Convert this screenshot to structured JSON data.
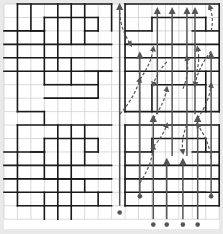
{
  "diagram": {
    "title": "",
    "background": "#e9e9e9",
    "panel_color": "#ffffff",
    "grid": {
      "origin_x": 4,
      "origin_y": 4,
      "cols": 16,
      "rows": 16,
      "cell": 13.45,
      "grid_color": "#cfcfcf",
      "wall_color": "#1a1a1a",
      "arrow_color": "#555555"
    },
    "walls": [
      [
        1,
        0,
        8,
        0
      ],
      [
        1,
        0,
        1,
        8
      ],
      [
        8,
        0,
        8,
        2
      ],
      [
        3,
        1,
        7,
        1
      ],
      [
        3,
        1,
        3,
        6
      ],
      [
        3,
        2,
        2,
        2
      ],
      [
        7,
        1,
        7,
        2
      ],
      [
        6,
        2,
        7,
        2
      ],
      [
        6,
        2,
        6,
        3
      ],
      [
        0,
        2,
        3,
        2
      ],
      [
        0,
        3,
        8,
        3
      ],
      [
        0,
        4,
        8,
        4
      ],
      [
        0,
        5,
        8,
        5
      ],
      [
        3,
        6,
        5,
        6
      ],
      [
        5,
        4,
        5,
        6
      ],
      [
        5,
        6,
        7,
        6
      ],
      [
        7,
        5,
        7,
        7
      ],
      [
        6,
        5,
        8,
        5
      ],
      [
        1,
        8,
        3,
        8
      ],
      [
        3,
        8,
        3,
        9
      ],
      [
        3,
        7,
        7,
        7
      ],
      [
        2,
        0,
        2,
        2
      ],
      [
        4,
        0,
        4,
        5
      ],
      [
        5,
        0,
        5,
        3
      ],
      [
        6,
        0,
        6,
        2
      ],
      [
        1,
        9,
        8,
        9
      ],
      [
        1,
        9,
        1,
        15
      ],
      [
        3,
        10,
        7,
        10
      ],
      [
        3,
        10,
        3,
        11
      ],
      [
        7,
        10,
        7,
        11
      ],
      [
        6,
        11,
        7,
        11
      ],
      [
        2,
        11,
        3,
        11
      ],
      [
        0,
        11,
        3,
        11
      ],
      [
        0,
        12,
        8,
        12
      ],
      [
        0,
        13,
        8,
        13
      ],
      [
        0,
        14,
        8,
        14
      ],
      [
        3,
        11,
        3,
        13
      ],
      [
        3,
        13,
        6,
        13
      ],
      [
        6,
        13,
        6,
        14
      ],
      [
        1,
        15,
        8,
        15
      ],
      [
        3,
        14,
        3,
        16
      ],
      [
        4,
        9,
        4,
        16
      ],
      [
        5,
        9,
        5,
        16
      ],
      [
        6,
        9,
        6,
        12
      ],
      [
        7,
        14,
        7,
        15
      ],
      [
        9,
        0,
        16,
        0
      ],
      [
        9,
        0,
        9,
        8
      ],
      [
        16,
        0,
        16,
        8
      ],
      [
        11,
        1,
        15,
        1
      ],
      [
        11,
        1,
        11,
        2
      ],
      [
        15,
        1,
        15,
        2
      ],
      [
        9,
        2,
        11,
        2
      ],
      [
        14,
        2,
        16,
        2
      ],
      [
        9,
        3,
        16,
        3
      ],
      [
        9,
        4,
        16,
        4
      ],
      [
        9,
        5,
        16,
        5
      ],
      [
        11,
        6,
        15,
        6
      ],
      [
        11,
        6,
        11,
        8
      ],
      [
        15,
        5,
        15,
        8
      ],
      [
        9,
        8,
        16,
        8
      ],
      [
        9,
        9,
        16,
        9
      ],
      [
        9,
        9,
        9,
        15
      ],
      [
        16,
        9,
        16,
        15
      ],
      [
        11,
        10,
        15,
        10
      ],
      [
        11,
        10,
        11,
        11
      ],
      [
        15,
        10,
        15,
        11
      ],
      [
        9,
        11,
        11,
        11
      ],
      [
        14,
        11,
        16,
        11
      ],
      [
        9,
        12,
        16,
        12
      ],
      [
        9,
        13,
        16,
        13
      ],
      [
        9,
        14,
        16,
        14
      ],
      [
        11,
        14,
        15,
        14
      ],
      [
        9,
        15,
        16,
        15
      ]
    ],
    "solid_arrows": [
      {
        "x": 8.6,
        "from": 15,
        "to": 0.2
      },
      {
        "x": 10.1,
        "from": 14.3,
        "to": 3.8
      },
      {
        "x": 11.1,
        "from": 16,
        "to": 8.5
      },
      {
        "x": 11.4,
        "from": 8.2,
        "to": 0.5
      },
      {
        "x": 12.1,
        "from": 16,
        "to": 11.7
      },
      {
        "x": 12.5,
        "from": 11.3,
        "to": 0.5
      },
      {
        "x": 13.3,
        "from": 16,
        "to": 11.7
      },
      {
        "x": 13.6,
        "from": 11.3,
        "to": 0.5
      },
      {
        "x": 14.4,
        "from": 16,
        "to": 8.5
      },
      {
        "x": 14.2,
        "from": 8.2,
        "to": 0.5
      },
      {
        "x": 15.4,
        "from": 14.3,
        "to": 3.8
      }
    ],
    "dashed_arrows": [
      {
        "from": [
          8.6,
          8.2
        ],
        "to": [
          10.1,
          5.6
        ]
      },
      {
        "from": [
          10.1,
          5.6
        ],
        "to": [
          11.1,
          3.3
        ]
      },
      {
        "from": [
          11.1,
          8.5
        ],
        "to": [
          12.1,
          6.3
        ]
      },
      {
        "from": [
          12.1,
          4.3
        ],
        "to": [
          11.1,
          6.0
        ]
      },
      {
        "from": [
          13.3,
          6.3
        ],
        "to": [
          13.6,
          4.0
        ]
      },
      {
        "from": [
          14.2,
          5.4
        ],
        "to": [
          14.4,
          3.3
        ]
      },
      {
        "from": [
          15.4,
          3.5
        ],
        "to": [
          14.2,
          6.0
        ]
      },
      {
        "from": [
          8.6,
          0.6
        ],
        "to": [
          9.4,
          3.0
        ]
      },
      {
        "from": [
          10.1,
          13.3
        ],
        "to": [
          11.1,
          10.6
        ]
      },
      {
        "from": [
          11.1,
          10.6
        ],
        "to": [
          12.1,
          9.0
        ]
      },
      {
        "from": [
          13.6,
          9.0
        ],
        "to": [
          13.3,
          11.0
        ]
      },
      {
        "from": [
          15.4,
          11.5
        ],
        "to": [
          14.4,
          9.0
        ]
      },
      {
        "from": [
          14.4,
          8.5
        ],
        "to": [
          15.4,
          6.0
        ]
      },
      {
        "from": [
          15.4,
          2.0
        ],
        "to": [
          15.3,
          0.2
        ]
      }
    ],
    "start_dots": [
      [
        8.6,
        15.5
      ],
      [
        10.1,
        14.3
      ],
      [
        11.1,
        16.4
      ],
      [
        12.1,
        16.4
      ],
      [
        13.3,
        16.4
      ],
      [
        14.4,
        16.4
      ],
      [
        15.4,
        14.3
      ]
    ]
  }
}
